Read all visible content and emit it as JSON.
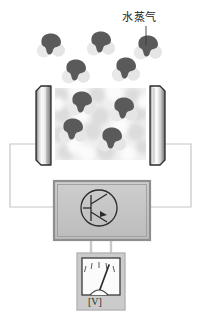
{
  "diagram": {
    "title_label": "水蒸气",
    "voltmeter_symbol": "[V]",
    "colors": {
      "molecule_dark": "#5a5a5a",
      "molecule_light": "#e4e4e4",
      "chamber_fill": "#eeeeee",
      "plate_dark": "#3a3a3a",
      "plate_light": "#fdfdfd",
      "box_fill": "#c4c4c4",
      "box_border": "#8a8a8a",
      "meter_face": "#fbfbfb",
      "meter_body": "#c9c9c9",
      "wire": "#bdbdbd",
      "outline": "#2b2b2b"
    },
    "leader_line": {
      "x1": 145,
      "y1": 25,
      "x2": 145,
      "y2": 47
    },
    "chamber": {
      "x": 55,
      "y": 88,
      "width": 91,
      "height": 72
    },
    "plates": [
      {
        "name": "left-plate",
        "x": 33,
        "y": 86,
        "width": 18,
        "height": 79
      },
      {
        "name": "right-plate",
        "x": 150,
        "y": 86,
        "width": 18,
        "height": 79
      }
    ],
    "free_molecules": [
      {
        "cx": 51,
        "cy": 46,
        "r": 1.0
      },
      {
        "cx": 101,
        "cy": 44,
        "r": 1.0
      },
      {
        "cx": 148,
        "cy": 48,
        "r": 1.0
      },
      {
        "cx": 76,
        "cy": 72,
        "r": 1.0
      },
      {
        "cx": 126,
        "cy": 70,
        "r": 1.0
      }
    ],
    "chamber_molecules": [
      {
        "cx": 82,
        "cy": 104,
        "r": 1.0
      },
      {
        "cx": 124,
        "cy": 110,
        "r": 1.0
      },
      {
        "cx": 73,
        "cy": 131,
        "r": 1.0
      },
      {
        "cx": 112,
        "cy": 140,
        "r": 1.0
      }
    ],
    "chamber_blobs": [
      {
        "cx": 60,
        "cy": 95,
        "r": 8
      },
      {
        "cx": 78,
        "cy": 92,
        "r": 9
      },
      {
        "cx": 97,
        "cy": 95,
        "r": 8
      },
      {
        "cx": 114,
        "cy": 92,
        "r": 9
      },
      {
        "cx": 133,
        "cy": 96,
        "r": 8
      },
      {
        "cx": 62,
        "cy": 114,
        "r": 9
      },
      {
        "cx": 100,
        "cy": 116,
        "r": 9
      },
      {
        "cx": 139,
        "cy": 113,
        "r": 8
      },
      {
        "cx": 59,
        "cy": 134,
        "r": 8
      },
      {
        "cx": 93,
        "cy": 131,
        "r": 9
      },
      {
        "cx": 136,
        "cy": 132,
        "r": 9
      },
      {
        "cx": 66,
        "cy": 152,
        "r": 8
      },
      {
        "cx": 87,
        "cy": 154,
        "r": 8
      },
      {
        "cx": 106,
        "cy": 152,
        "r": 9
      },
      {
        "cx": 128,
        "cy": 154,
        "r": 8
      },
      {
        "cx": 143,
        "cy": 147,
        "r": 7
      }
    ],
    "source_box": {
      "x": 54,
      "y": 181,
      "width": 96,
      "height": 59,
      "symbol": "oscillator-transistor-symbol"
    },
    "voltmeter": {
      "x": 77,
      "y": 253,
      "width": 48,
      "height": 57,
      "needle_angle": -28
    },
    "wires": {
      "left_path": "M 33 144 L 10 144 L 10 207 L 54 207",
      "right_path": "M 168 144 L 191 144 L 191 207 L 150 207",
      "meter_left": "M 91 240 L 91 253",
      "meter_right": "M 111 240 L 111 253"
    }
  }
}
